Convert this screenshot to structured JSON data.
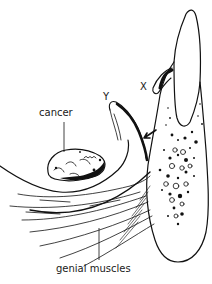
{
  "figure": {
    "labels": {
      "x": "X",
      "y": "Y",
      "cancer": "cancer",
      "genial_muscles": "genial muscles"
    },
    "colors": {
      "line": "#111111",
      "background": "#ffffff"
    }
  }
}
